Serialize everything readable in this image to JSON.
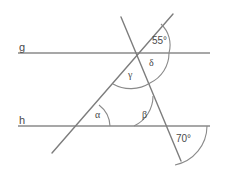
{
  "figure": {
    "canvas": {
      "width": 225,
      "height": 177,
      "background": "#ffffff"
    },
    "stroke_color": "#8a8a8a",
    "text_color": "#4a4a4a",
    "lines": [
      {
        "name": "g",
        "label": "g",
        "type": "parallel-line",
        "y": 53,
        "x1": 18,
        "x2": 210
      },
      {
        "name": "h",
        "label": "h",
        "type": "parallel-line",
        "y": 126,
        "x1": 18,
        "x2": 210
      },
      {
        "name": "t1",
        "label": "",
        "type": "transversal",
        "x1": 52,
        "y1": 153,
        "x2": 173,
        "y2": 14
      },
      {
        "name": "t2",
        "label": "",
        "type": "transversal",
        "x1": 121,
        "y1": 17,
        "x2": 181,
        "y2": 161
      }
    ],
    "labels": {
      "line_g": "g",
      "line_h": "h",
      "angle_alpha": "α",
      "angle_beta": "β",
      "angle_gamma": "γ",
      "angle_delta": "δ",
      "angle_55": "55°",
      "angle_70": "70°"
    },
    "angles": [
      {
        "name": "alpha",
        "symbol": "α",
        "vertex_x": 82,
        "vertex_y": 126,
        "label_x": 96,
        "label_y": 112,
        "value": null
      },
      {
        "name": "beta",
        "symbol": "β",
        "vertex_x": 167,
        "vertex_y": 126,
        "label_x": 143,
        "label_y": 112,
        "value": null
      },
      {
        "name": "gamma",
        "symbol": "γ",
        "vertex_x": 136,
        "vertex_y": 53,
        "label_x": 129,
        "label_y": 73,
        "value": null
      },
      {
        "name": "delta",
        "symbol": "δ",
        "vertex_x": 136,
        "vertex_y": 53,
        "label_x": 150,
        "label_y": 62,
        "value": null
      },
      {
        "name": "top-right",
        "symbol": "55°",
        "vertex_x": 136,
        "vertex_y": 53,
        "label_x": 152,
        "label_y": 39,
        "value": "55°"
      },
      {
        "name": "bottom-right",
        "symbol": "70°",
        "vertex_x": 167,
        "vertex_y": 126,
        "label_x": 177,
        "label_y": 138,
        "value": "70°"
      }
    ]
  }
}
